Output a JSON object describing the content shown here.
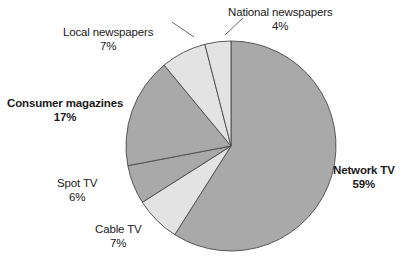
{
  "chart_data": {
    "type": "pie",
    "title": "",
    "subtitle": "",
    "xlabel": "",
    "ylabel": "",
    "legend_position": "none",
    "grid": false,
    "unit": "%",
    "start_angle_deg": 0,
    "direction": "clockwise",
    "categories": [
      "Network TV",
      "Cable TV",
      "Spot TV",
      "Consumer magazines",
      "Local newspapers",
      "National newspapers"
    ],
    "values": [
      59,
      7,
      6,
      17,
      7,
      4
    ],
    "slices": [
      {
        "name": "Network TV",
        "value": 59,
        "value_label": "59%",
        "color": "#a9a9a9",
        "emphasis": "bold",
        "label_position": "right"
      },
      {
        "name": "Cable TV",
        "value": 7,
        "value_label": "7%",
        "color": "#e3e3e3",
        "emphasis": "normal",
        "label_position": "bottom-left"
      },
      {
        "name": "Spot TV",
        "value": 6,
        "value_label": "6%",
        "color": "#a9a9a9",
        "emphasis": "normal",
        "label_position": "left-lower"
      },
      {
        "name": "Consumer magazines",
        "value": 17,
        "value_label": "17%",
        "color": "#a9a9a9",
        "emphasis": "bold",
        "label_position": "left"
      },
      {
        "name": "Local newspapers",
        "value": 7,
        "value_label": "7%",
        "color": "#e3e3e3",
        "emphasis": "normal",
        "label_position": "top-left"
      },
      {
        "name": "National newspapers",
        "value": 4,
        "value_label": "4%",
        "color": "#e3e3e3",
        "emphasis": "normal",
        "label_position": "top-right"
      }
    ],
    "colors": {
      "dark_slice": "#a9a9a9",
      "light_slice": "#e3e3e3",
      "slice_outline": "#4a4a4a",
      "leader_line": "#555555",
      "text": "#1a1a1a",
      "background": "#ffffff"
    },
    "geometry": {
      "center_x": 231,
      "center_y": 146,
      "radius": 105
    }
  },
  "labels": {
    "national_newspapers": {
      "name": "National newspapers",
      "pct": "4%"
    },
    "local_newspapers": {
      "name": "Local newspapers",
      "pct": "7%"
    },
    "consumer_magazines": {
      "name": "Consumer magazines",
      "pct": "17%"
    },
    "spot_tv": {
      "name": "Spot TV",
      "pct": "6%"
    },
    "cable_tv": {
      "name": "Cable TV",
      "pct": "7%"
    },
    "network_tv": {
      "name": "Network TV",
      "pct": "59%"
    }
  }
}
